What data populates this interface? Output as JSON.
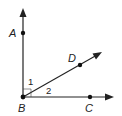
{
  "diagram": {
    "type": "geometry-angles",
    "vertex": {
      "label": "B",
      "x": 23,
      "y": 97
    },
    "points": [
      {
        "label": "A",
        "x": 23,
        "y": 33
      },
      {
        "label": "D",
        "x": 80,
        "y": 65
      },
      {
        "label": "C",
        "x": 90,
        "y": 97
      }
    ],
    "rays": [
      {
        "from": "B",
        "through": "A"
      },
      {
        "from": "B",
        "through": "D"
      },
      {
        "from": "B",
        "through": "C"
      }
    ],
    "angles": [
      {
        "label": "1",
        "between": [
          "BA",
          "BD"
        ]
      },
      {
        "label": "2",
        "between": [
          "BD",
          "BC"
        ]
      }
    ],
    "right_angle_mark": "ABC",
    "labels": {
      "A": "A",
      "B": "B",
      "C": "C",
      "D": "D",
      "angle1": "1",
      "angle2": "2"
    },
    "colors": {
      "stroke": "#222222",
      "background": "#ffffff"
    }
  }
}
